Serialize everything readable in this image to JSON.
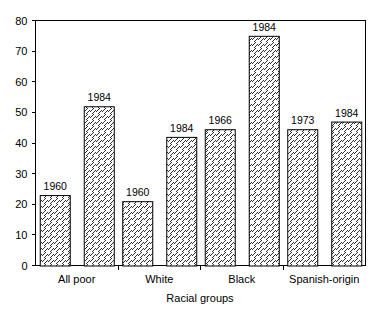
{
  "chart_data": {
    "type": "bar",
    "title": "",
    "subtitle": "",
    "xlabel": "Racial groups",
    "ylabel": "",
    "ylim": [
      0,
      80
    ],
    "yticks": [
      0,
      10,
      20,
      30,
      40,
      50,
      60,
      70,
      80
    ],
    "ytick_labels": [
      "0",
      "10",
      "20",
      "30",
      "40",
      "50",
      "60",
      "70",
      "80"
    ],
    "categories": [
      "All poor",
      "White",
      "Black",
      "Spanish-origin"
    ],
    "grid": false,
    "legend": "none",
    "bar_fill": "hatch-diagonal",
    "bar_edge_color": "#000000",
    "bar_face_color": "#ffffff",
    "bars": [
      {
        "group": "All poor",
        "label": "1960",
        "value": 23
      },
      {
        "group": "All poor",
        "label": "1984",
        "value": 52
      },
      {
        "group": "White",
        "label": "1960",
        "value": 21
      },
      {
        "group": "White",
        "label": "1984",
        "value": 42
      },
      {
        "group": "Black",
        "label": "1966",
        "value": 44.5
      },
      {
        "group": "Black",
        "label": "1984",
        "value": 75
      },
      {
        "group": "Spanish-origin",
        "label": "1973",
        "value": 44.5
      },
      {
        "group": "Spanish-origin",
        "label": "1984",
        "value": 47
      }
    ],
    "series": [
      {
        "name": "earlier-year",
        "values": [
          23,
          21,
          44.5,
          44.5
        ],
        "point_labels": [
          "1960",
          "1960",
          "1966",
          "1973"
        ]
      },
      {
        "name": "1984",
        "values": [
          52,
          42,
          75,
          47
        ],
        "point_labels": [
          "1984",
          "1984",
          "1984",
          "1984"
        ]
      }
    ]
  }
}
